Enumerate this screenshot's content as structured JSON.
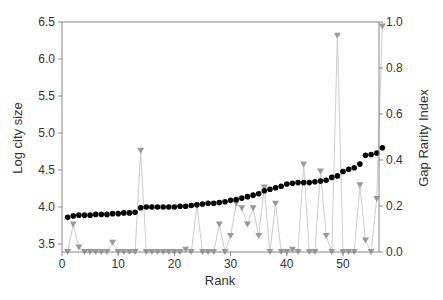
{
  "chart_data": {
    "type": "line",
    "title": "",
    "xlabel": "Rank",
    "ylabel": "Log city size",
    "ylabel_right": "Gap Rarity Index",
    "xlim": [
      0,
      57
    ],
    "ylim": [
      3.4,
      6.5
    ],
    "ylim_right": [
      0.0,
      1.0
    ],
    "x_ticks": [
      0,
      10,
      20,
      30,
      40,
      50
    ],
    "y_ticks": [
      3.5,
      4.0,
      4.5,
      5.0,
      5.5,
      6.0,
      6.5
    ],
    "y_ticks_right": [
      0.0,
      0.2,
      0.4,
      0.6,
      0.8,
      1.0
    ],
    "grid": false,
    "x": [
      1,
      2,
      3,
      4,
      5,
      6,
      7,
      8,
      9,
      10,
      11,
      12,
      13,
      14,
      15,
      16,
      17,
      18,
      19,
      20,
      21,
      22,
      23,
      24,
      25,
      26,
      27,
      28,
      29,
      30,
      31,
      32,
      33,
      34,
      35,
      36,
      37,
      38,
      39,
      40,
      41,
      42,
      43,
      44,
      45,
      46,
      47,
      48,
      49,
      50,
      51,
      52,
      53,
      54,
      55,
      56,
      57
    ],
    "series": [
      {
        "name": "Log city size",
        "axis": "left",
        "marker": "circle",
        "color": "#000000",
        "values": [
          3.86,
          3.88,
          3.89,
          3.89,
          3.89,
          3.9,
          3.9,
          3.9,
          3.91,
          3.91,
          3.92,
          3.92,
          3.93,
          3.99,
          4.0,
          4.0,
          4.0,
          4.0,
          4.0,
          4.0,
          4.01,
          4.01,
          4.02,
          4.03,
          4.04,
          4.05,
          4.05,
          4.06,
          4.07,
          4.09,
          4.1,
          4.12,
          4.14,
          4.16,
          4.18,
          4.22,
          4.24,
          4.26,
          4.28,
          4.31,
          4.32,
          4.33,
          4.33,
          4.33,
          4.34,
          4.35,
          4.36,
          4.4,
          4.42,
          4.48,
          4.51,
          4.53,
          4.58,
          4.7,
          4.71,
          4.73,
          4.8
        ]
      },
      {
        "name": "Gap Rarity Index",
        "axis": "right",
        "marker": "triangle-down",
        "color": "#999999",
        "line_color": "#cccccc",
        "values": [
          0.0,
          0.12,
          0.02,
          0.0,
          0.0,
          0.0,
          0.0,
          0.0,
          0.04,
          0.0,
          0.0,
          0.0,
          0.0,
          0.44,
          0.0,
          0.0,
          0.0,
          0.0,
          0.0,
          0.0,
          0.0,
          0.01,
          0.0,
          0.2,
          0.0,
          0.0,
          0.0,
          0.12,
          0.0,
          0.07,
          0.21,
          0.19,
          0.12,
          0.19,
          0.07,
          0.28,
          0.0,
          0.21,
          0.0,
          0.0,
          0.01,
          0.0,
          0.38,
          0.0,
          0.0,
          0.35,
          0.07,
          0.0,
          0.94,
          0.0,
          0.0,
          0.0,
          0.29,
          0.05,
          0.0,
          0.23,
          0.98
        ]
      }
    ],
    "legend": null
  }
}
